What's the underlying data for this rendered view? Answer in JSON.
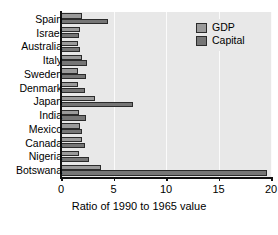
{
  "chart_data": {
    "type": "bar",
    "orientation": "horizontal",
    "title": "",
    "xlabel": "Ratio of 1990 to 1965 value",
    "ylabel": "",
    "xlim": [
      0,
      20
    ],
    "xticks": [
      0,
      5,
      10,
      15,
      20
    ],
    "xtick_labels": [
      "0",
      "5",
      "10",
      "15",
      "20"
    ],
    "grid": true,
    "grid_axis": "x",
    "legend_position": "top-right",
    "categories": [
      "Spain",
      "Israel",
      "Australia",
      "Italy",
      "Sweden",
      "Denmark",
      "Japan",
      "India",
      "Mexico",
      "Canada",
      "Nigeria",
      "Botswana"
    ],
    "series": [
      {
        "name": "GDP",
        "color": "#9a9a9a",
        "values": [
          2.0,
          1.8,
          1.6,
          2.0,
          1.6,
          1.6,
          3.2,
          1.7,
          1.8,
          2.0,
          1.7,
          3.8
        ]
      },
      {
        "name": "Capital",
        "color": "#767676",
        "values": [
          4.5,
          1.7,
          1.8,
          2.5,
          2.4,
          2.3,
          6.9,
          2.4,
          2.0,
          2.3,
          2.7,
          19.6
        ]
      }
    ]
  },
  "legend": {
    "items": [
      {
        "label": "GDP"
      },
      {
        "label": "Capital"
      }
    ]
  },
  "colors": {
    "gdp": "#9a9a9a",
    "capital": "#767676",
    "plot_background": "#e8e8e8",
    "gridline": "#fbfbfb",
    "axis": "#121212"
  }
}
